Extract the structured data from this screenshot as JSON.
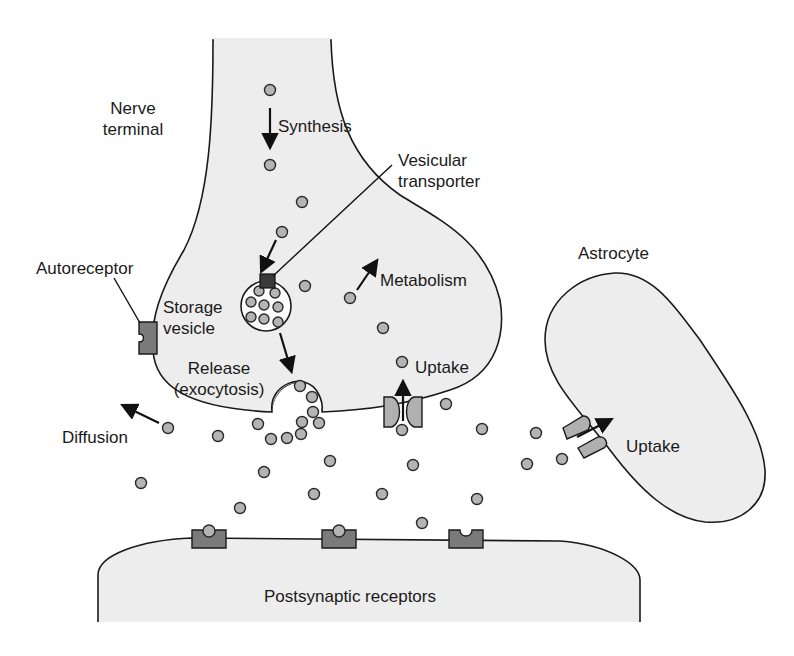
{
  "labels": {
    "nerve_terminal_line1": "Nerve",
    "nerve_terminal_line2": "terminal",
    "synthesis": "Synthesis",
    "vesicular_transporter_line1": "Vesicular",
    "vesicular_transporter_line2": "transporter",
    "autoreceptor": "Autoreceptor",
    "storage_vesicle_line1": "Storage",
    "storage_vesicle_line2": "vesicle",
    "metabolism": "Metabolism",
    "astrocyte": "Astrocyte",
    "release_line1": "Release",
    "release_line2": "(exocytosis)",
    "uptake_presynaptic": "Uptake",
    "uptake_astrocyte": "Uptake",
    "diffusion": "Diffusion",
    "postsynaptic_receptors": "Postsynaptic receptors"
  },
  "colors": {
    "background": "#ffffff",
    "cell_fill": "#ededed",
    "outline": "#1a1a1a",
    "molecule_fill": "#b4b4b4",
    "receptor_fill": "#7a7a7a",
    "transporter_fill": "#b0b0b0"
  },
  "postsynaptic_receptors": [
    {
      "x": 209,
      "state": "bound"
    },
    {
      "x": 339,
      "state": "bound"
    },
    {
      "x": 466,
      "state": "empty"
    }
  ],
  "free_molecules": [
    [
      270,
      90
    ],
    [
      270,
      165
    ],
    [
      302,
      202
    ],
    [
      282,
      232
    ],
    [
      305,
      286
    ],
    [
      350,
      298
    ],
    [
      383,
      328
    ],
    [
      402,
      362
    ],
    [
      402,
      430
    ],
    [
      446,
      404
    ],
    [
      168,
      428
    ],
    [
      218,
      436
    ],
    [
      258,
      424
    ],
    [
      271,
      439
    ],
    [
      287,
      438
    ],
    [
      301,
      434
    ],
    [
      300,
      386
    ],
    [
      312,
      397
    ],
    [
      313,
      412
    ],
    [
      302,
      422
    ],
    [
      319,
      423
    ],
    [
      482,
      429
    ],
    [
      536,
      433
    ],
    [
      562,
      459
    ],
    [
      527,
      464
    ],
    [
      413,
      465
    ],
    [
      330,
      461
    ],
    [
      264,
      472
    ],
    [
      141,
      483
    ],
    [
      240,
      508
    ],
    [
      314,
      494
    ],
    [
      382,
      494
    ],
    [
      477,
      499
    ],
    [
      422,
      523
    ]
  ],
  "vesicle_molecules": [
    [
      259,
      291
    ],
    [
      275,
      293
    ],
    [
      251,
      302
    ],
    [
      264,
      305
    ],
    [
      278,
      307
    ],
    [
      251,
      317
    ],
    [
      264,
      319
    ],
    [
      278,
      322
    ]
  ]
}
